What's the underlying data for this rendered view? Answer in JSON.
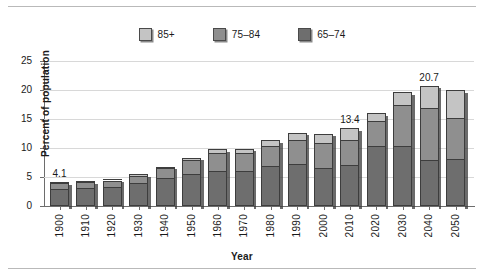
{
  "chart_data": {
    "type": "bar",
    "subtype": "stacked-vertical",
    "title": "",
    "xlabel": "Year",
    "ylabel": "Percent of population",
    "ylim": [
      0,
      25
    ],
    "yticks": [
      0,
      5,
      10,
      15,
      20,
      25
    ],
    "grid": true,
    "legend_position": "top-center",
    "categories": [
      "1900",
      "1910",
      "1920",
      "1930",
      "1940",
      "1950",
      "1960",
      "1970",
      "1980",
      "1990",
      "2000",
      "2010",
      "2020",
      "2030",
      "2040",
      "2050"
    ],
    "series": [
      {
        "name": "65–74",
        "color": "#6e6e6e",
        "values": [
          3.0,
          3.1,
          3.3,
          3.9,
          4.8,
          5.6,
          6.1,
          6.1,
          6.9,
          7.3,
          6.5,
          7.0,
          10.3,
          10.4,
          7.9,
          8.1
        ]
      },
      {
        "name": "75–84",
        "color": "#8f8f8f",
        "values": [
          0.9,
          1.0,
          1.1,
          1.3,
          1.7,
          2.3,
          3.1,
          3.0,
          3.4,
          4.0,
          4.4,
          4.3,
          4.3,
          7.0,
          9.0,
          7.0
        ]
      },
      {
        "name": "85+",
        "color": "#c4c4c4",
        "values": [
          0.2,
          0.2,
          0.2,
          0.3,
          0.3,
          0.4,
          0.6,
          0.8,
          1.0,
          1.3,
          1.6,
          2.1,
          1.4,
          2.2,
          3.8,
          4.9
        ]
      }
    ],
    "totals": [
      4.1,
      4.3,
      4.6,
      5.5,
      6.8,
      8.3,
      9.8,
      9.9,
      11.3,
      12.6,
      12.5,
      13.4,
      16.0,
      19.6,
      20.7,
      20.0
    ],
    "value_labels": [
      {
        "category": "1900",
        "text": "4.1"
      },
      {
        "category": "2010",
        "text": "13.4"
      },
      {
        "category": "2040",
        "text": "20.7"
      }
    ]
  },
  "legend": {
    "items": [
      {
        "label": "85+",
        "color": "#c4c4c4"
      },
      {
        "label": "75–84",
        "color": "#8f8f8f"
      },
      {
        "label": "65–74",
        "color": "#6e6e6e"
      }
    ]
  },
  "axes": {
    "y": {
      "label": "Percent of population",
      "ticks": [
        "0",
        "5",
        "10",
        "15",
        "20",
        "25"
      ]
    },
    "x": {
      "label": "Year",
      "ticks": [
        "1900",
        "1910",
        "1920",
        "1930",
        "1940",
        "1950",
        "1960",
        "1970",
        "1980",
        "1990",
        "2000",
        "2010",
        "2020",
        "2030",
        "2040",
        "2050"
      ]
    }
  }
}
